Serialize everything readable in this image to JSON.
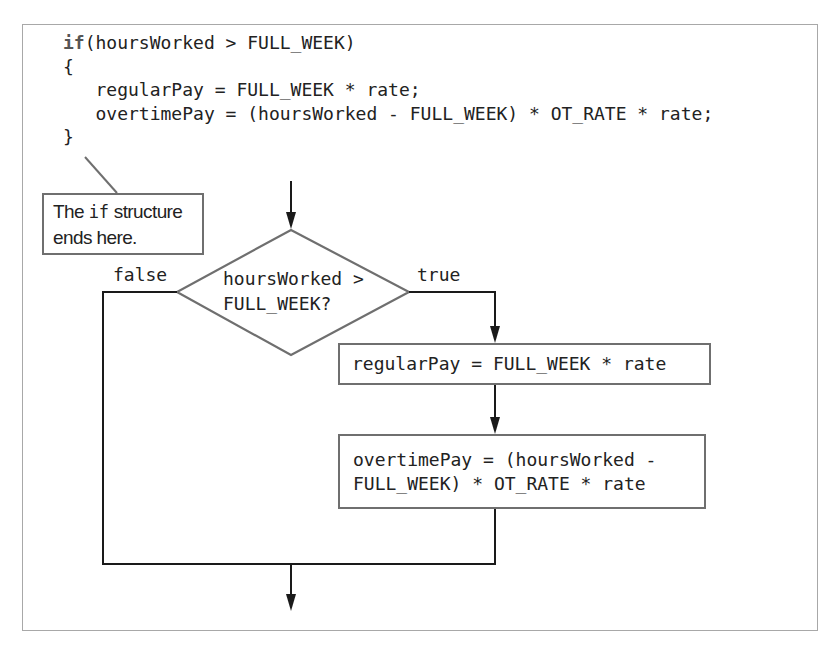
{
  "code": {
    "keyword": "if",
    "line1_rest": "(hoursWorked > FULL_WEEK)",
    "line2": "{",
    "line3": "   regularPay = FULL_WEEK * rate;",
    "line4": "   overtimePay = (hoursWorked - FULL_WEEK) * OT_RATE * rate;",
    "line5": "}"
  },
  "callout": {
    "text_before": "The ",
    "keyword": "if",
    "text_after": " structure",
    "line2": "ends here."
  },
  "flowchart": {
    "decision_line1": "hoursWorked >",
    "decision_line2": "FULL_WEEK?",
    "false_label": "false",
    "true_label": "true",
    "process1": "regularPay = FULL_WEEK * rate",
    "process2_line1": "overtimePay = (hoursWorked -",
    "process2_line2": "FULL_WEEK) * OT_RATE * rate"
  },
  "colors": {
    "frame_border": "#a8a8a8",
    "shape_border": "#6f6f6f",
    "arrow": "#1a1a1a",
    "keyword": "#555555",
    "text": "#222222"
  }
}
